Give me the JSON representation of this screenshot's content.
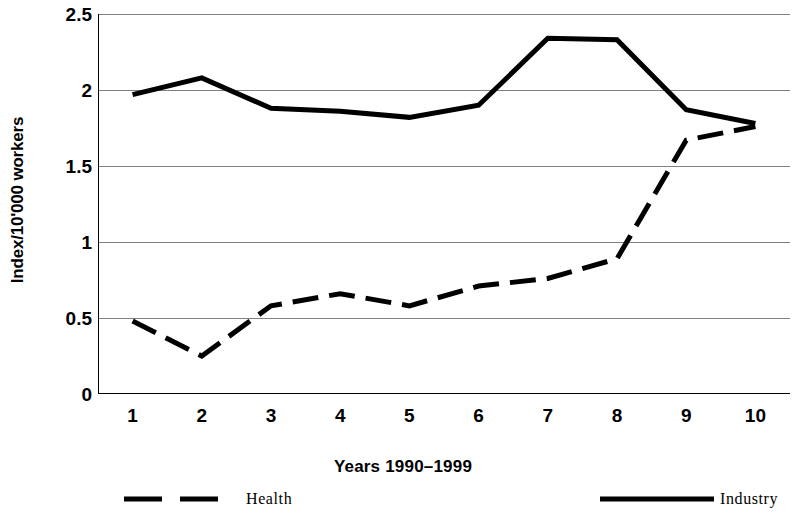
{
  "chart_data": {
    "type": "line",
    "title": "",
    "xlabel": "Years 1990–1999",
    "ylabel": "Index/10'000 workers",
    "categories": [
      "1",
      "2",
      "3",
      "4",
      "5",
      "6",
      "7",
      "8",
      "9",
      "10"
    ],
    "x_tick_labels": [
      "1",
      "2",
      "3",
      "4",
      "5",
      "6",
      "7",
      "8",
      "9",
      "10"
    ],
    "y_tick_labels": [
      "0",
      "0.5",
      "1",
      "1.5",
      "2",
      "2.5"
    ],
    "y_ticks": [
      0,
      0.5,
      1,
      1.5,
      2,
      2.5
    ],
    "ylim": [
      0,
      2.5
    ],
    "grid": "horizontal",
    "legend_position": "bottom",
    "series": [
      {
        "name": "Health",
        "style": "dashed",
        "color": "#000000",
        "values": [
          0.48,
          0.25,
          0.58,
          0.66,
          0.58,
          0.71,
          0.76,
          0.89,
          1.67,
          1.76
        ]
      },
      {
        "name": "Industry",
        "style": "solid",
        "color": "#000000",
        "values": [
          1.97,
          2.08,
          1.88,
          1.86,
          1.82,
          1.9,
          2.34,
          2.33,
          1.87,
          1.78
        ]
      }
    ]
  },
  "legend": {
    "entries": [
      {
        "label": "Health",
        "style": "dashed"
      },
      {
        "label": "Industry",
        "style": "solid"
      }
    ]
  },
  "colors": {
    "axis": "#000000",
    "grid": "#808080",
    "series": "#000000",
    "background": "#ffffff"
  }
}
